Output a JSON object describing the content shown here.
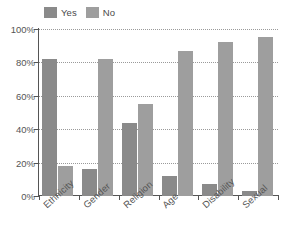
{
  "chart_data": {
    "type": "bar",
    "title": "",
    "subtitle": "",
    "xlabel": "",
    "ylabel": "",
    "categories": [
      "Ethnicity",
      "Gender",
      "Religion",
      "Age",
      "Disability",
      "Sexual"
    ],
    "series": [
      {
        "name": "Yes",
        "color": "#8a8a8a",
        "values": [
          82,
          16,
          44,
          12,
          7,
          3
        ]
      },
      {
        "name": "No",
        "color": "#9e9e9e",
        "values": [
          18,
          82,
          55,
          87,
          92,
          95
        ]
      }
    ],
    "ylim": [
      0,
      100
    ],
    "yticks": [
      0,
      20,
      40,
      60,
      80,
      100
    ],
    "ytick_labels": [
      "0%",
      "20%",
      "40%",
      "60%",
      "80%",
      "100%"
    ],
    "grid": "horizontal-dotted",
    "legend_position": "top-left",
    "legend": [
      {
        "label": "Yes",
        "color": "#8a8a8a"
      },
      {
        "label": "No",
        "color": "#9e9e9e"
      }
    ]
  }
}
